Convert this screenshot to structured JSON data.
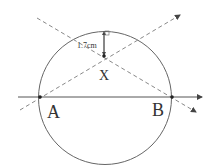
{
  "diagram": {
    "type": "geometry",
    "circle": {
      "cx": 105,
      "cy": 98,
      "r": 67
    },
    "points": {
      "A": {
        "label": "A",
        "x": 40,
        "y": 97
      },
      "B": {
        "label": "B",
        "x": 172,
        "y": 97
      },
      "X": {
        "label": "X",
        "x": 104,
        "y": 56
      }
    },
    "chord_line": {
      "x1": 18,
      "y1": 97,
      "x2": 202,
      "y2": 97
    },
    "dashed_lines": [
      {
        "from": [
          20,
          110
        ],
        "to": [
          180,
          15
        ]
      },
      {
        "from": [
          37,
          18
        ],
        "to": [
          196,
          112
        ]
      }
    ],
    "measurement": {
      "label": "1.7cm",
      "from": [
        104,
        31
      ],
      "to": [
        104,
        56
      ]
    },
    "colors": {
      "stroke": "#555555",
      "dash": "#777777",
      "text": "#333333"
    }
  }
}
